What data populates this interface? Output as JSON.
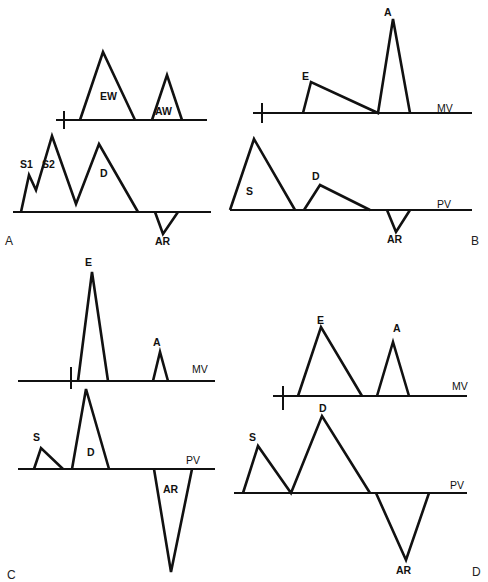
{
  "figure": {
    "background": "#ffffff",
    "stroke_color": "#111111",
    "panels": [
      {
        "id": "A",
        "letter": "A",
        "letter_pos": [
          5,
          245
        ],
        "rows": [
          {
            "name": "mv",
            "trace_label": "",
            "trace_label_pos": null,
            "baseline": [
              56,
              120,
              207,
              120
            ],
            "tick": [
              64,
              111,
              64,
              129
            ],
            "path": "M80,120 L103,52 L135,120 M152,120 L167,75 L182,120",
            "waves": [
              {
                "label": "EW",
                "pos": [
                  100,
                  100
                ]
              },
              {
                "label": "AW",
                "pos": [
                  155,
                  115
                ]
              }
            ]
          },
          {
            "name": "pv",
            "trace_label": "",
            "trace_label_pos": null,
            "baseline": [
              13,
              212,
              211,
              212
            ],
            "tick": null,
            "path": "M21,212 L29,175 L36,190 L52,136 L76,204 L99,144 L138,212 M155,212 L163,234 L178,212",
            "waves": [
              {
                "label": "S1",
                "pos": [
                  20,
                  168
                ]
              },
              {
                "label": "S2",
                "pos": [
                  42,
                  168
                ]
              },
              {
                "label": "D",
                "pos": [
                  100,
                  177
                ]
              },
              {
                "label": "AR",
                "pos": [
                  155,
                  245
                ]
              }
            ]
          }
        ]
      },
      {
        "id": "B",
        "letter": "B",
        "letter_pos": [
          471,
          245
        ],
        "rows": [
          {
            "name": "mv",
            "trace_label": "MV",
            "trace_label_pos": [
              437,
              112
            ],
            "baseline": [
              253,
              113,
              472,
              113
            ],
            "tick": [
              262,
              103,
              262,
              123
            ],
            "path": "M303,113 L311,82 L378,113 L393,19 L410,113",
            "waves": [
              {
                "label": "E",
                "pos": [
                  302,
                  80
                ]
              },
              {
                "label": "A",
                "pos": [
                  384,
                  16
                ]
              }
            ]
          },
          {
            "name": "pv",
            "trace_label": "PV",
            "trace_label_pos": [
              437,
              208
            ],
            "baseline": [
              230,
              210,
              472,
              210
            ],
            "tick": null,
            "path": "M230,210 L254,139 L295,210 M304,210 L320,185 L370,210 M387,210 L396,232 L410,210",
            "waves": [
              {
                "label": "S",
                "pos": [
                  246,
                  195
                ]
              },
              {
                "label": "D",
                "pos": [
                  312,
                  180
                ]
              },
              {
                "label": "AR",
                "pos": [
                  387,
                  243
                ]
              }
            ]
          }
        ]
      },
      {
        "id": "C",
        "letter": "C",
        "letter_pos": [
          7,
          579
        ],
        "rows": [
          {
            "name": "mv",
            "trace_label": "MV",
            "trace_label_pos": [
              192,
              373
            ],
            "baseline": [
              18,
              381,
              215,
              381
            ],
            "tick": [
              71,
              367,
              71,
              389
            ],
            "path": "M78,381 L92,272 L108,381 M153,381 L160,352 L168,381",
            "waves": [
              {
                "label": "E",
                "pos": [
                  85,
                  266
                ]
              },
              {
                "label": "A",
                "pos": [
                  153,
                  346
                ]
              }
            ]
          },
          {
            "name": "pv",
            "trace_label": "PV",
            "trace_label_pos": [
              186,
              464
            ],
            "baseline": [
              18,
              469,
              215,
              469
            ],
            "tick": null,
            "path": "M34,469 L41,448 L63,469 M72,469 L86,389 L109,469 M154,469 L171,572 L192,469",
            "waves": [
              {
                "label": "S",
                "pos": [
                  33,
                  441
                ]
              },
              {
                "label": "D",
                "pos": [
                  87,
                  456
                ]
              },
              {
                "label": "AR",
                "pos": [
                  163,
                  493
                ]
              }
            ]
          }
        ]
      },
      {
        "id": "D",
        "letter": "D",
        "letter_pos": [
          472,
          576
        ],
        "rows": [
          {
            "name": "mv",
            "trace_label": "MV",
            "trace_label_pos": [
              452,
              390
            ],
            "baseline": [
              273,
              396,
              467,
              396
            ],
            "tick": [
              283,
              386,
              283,
              410
            ],
            "path": "M298,396 L321,327 L362,396 M377,396 L393,342 L409,396",
            "waves": [
              {
                "label": "E",
                "pos": [
                  317,
                  324
                ]
              },
              {
                "label": "A",
                "pos": [
                  393,
                  332
                ]
              }
            ]
          },
          {
            "name": "pv",
            "trace_label": "PV",
            "trace_label_pos": [
              450,
              489
            ],
            "baseline": [
              234,
              493,
              467,
              493
            ],
            "tick": null,
            "path": "M243,493 L258,446 L291,493 L322,416 L370,493 M376,493 L406,560 L429,493",
            "waves": [
              {
                "label": "S",
                "pos": [
                  249,
                  441
                ]
              },
              {
                "label": "D",
                "pos": [
                  319,
                  412
                ]
              },
              {
                "label": "AR",
                "pos": [
                  396,
                  574
                ]
              }
            ]
          }
        ]
      }
    ]
  }
}
